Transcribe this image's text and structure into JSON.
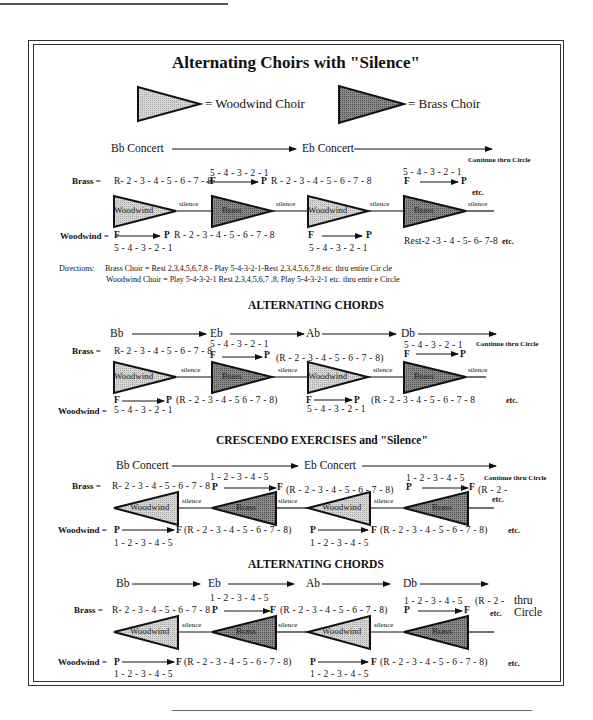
{
  "page": {
    "running_header": "",
    "title": "Alternating Choirs with \"Silence\"",
    "legend": {
      "woodwind": "= Woodwind Choir",
      "brass": "= Brass Choir",
      "woodwind_color": "#c8c8c8",
      "brass_color": "#7a7a7a"
    }
  },
  "section1": {
    "key1": "Bb Concert",
    "key2": "Eb Concert",
    "continue": "Continue thru Circle",
    "brass_label": "Brass =",
    "woodwind_label": "Woodwind =",
    "brass_rest1": "R- 2 - 3 - 4 - 5 - 6 - 7 - 8",
    "brass_play1_counts": "5 - 4 - 3 - 2 - 1",
    "brass_rest2": "R - 2 - 3 - 4 - 5 - 6 - 7 - 8",
    "brass_play2_counts": "5 - 4 - 3 - 2 - 1",
    "ww_rest1": "R - 2 - 3 - 4 - 5 - 6 - 7 - 8",
    "ww_play1_counts": "5 - 4 - 3 - 2 - 1",
    "ww_play2_counts": "5 - 4 - 3 - 2 - 1",
    "ww_rest2": "Rest-2 -3 - 4 - 5- 6- 7-8",
    "etc": "etc.",
    "F": "F",
    "P": "P",
    "silence": "silence",
    "tri_woodwind": "Woodwind",
    "tri_brass": "Brass",
    "directions_label": "Directions:",
    "directions_brass": "Brass Choir = Rest 2,3,4,5,6,7,8 - Play 5-4-3-2-1-Rest  2,3,4,5,6,7,8 etc. thru entire Cir cle",
    "directions_woodwind": "Woodwind Choir  = Play 5-4-3-2-1 Rest 2,3,4,5,6,7 ,8, Play 5-4-3-2-1 etc. thru entir e Circle"
  },
  "section2": {
    "heading": "ALTERNATING CHORDS",
    "keys": [
      "Bb",
      "Eb",
      "Ab",
      "Db"
    ],
    "continue": "Continue thru Circle",
    "brass_label": "Brass =",
    "woodwind_label": "Woodwind =",
    "brass_rest1": "R- 2 - 3 - 4 - 5 - 6 - 7 - 8",
    "brass_play1_counts": "5 - 4 - 3 - 2 - 1",
    "brass_rest2": "(R - 2 - 3 - 4 - 5 - 6 - 7 - 8)",
    "brass_play2_counts": "5 - 4 - 3 - 2 - 1",
    "ww_counts1": "5 - 4 - 3 - 2 - 1",
    "ww_rest1": "(R - 2 - 3 - 4 - 5  6 - 7 - 8)",
    "ww_counts2": "5 - 4 - 3 - 2 - 1",
    "ww_rest2": "(R - 2 - 3 - 4 - 5 - 6 - 7 - 8",
    "etc": "etc.",
    "F": "F",
    "P": "P",
    "silence": "silence",
    "tri_woodwind": "Woodwind",
    "tri_brass": "Brass"
  },
  "section3": {
    "heading": "CRESCENDO EXERCISES and \"Silence\"",
    "key1": "Bb Concert",
    "key2": "Eb Concert",
    "continue": "Continue thru Circle",
    "brass_label": "Brass =",
    "woodwind_label": "Woodwind =",
    "brass_rest1": "R- 2 - 3 - 4 - 5 - 6 - 7 - 8",
    "brass_play1_counts": "1 - 2 - 3 - 4 - 5",
    "brass_rest2": "(R - 2 - 3 - 4 - 5 - 6 - 7  -  8)",
    "brass_play2_counts": "1 - 2 - 3 - 4 - 5",
    "brass_rest3": "(R - 2 -",
    "ww_rest1": "(R - 2 - 3 - 4 - 5 - 6 - 7  -  8)",
    "ww_counts1": "1 - 2 - 3 - 4 - 5",
    "ww_rest2": "(R - 2 - 3 - 4  -  5 - 6 - 7 - 8)",
    "ww_counts2": "1 - 2 - 3 - 4 - 5",
    "etc": "etc.",
    "F": "F",
    "P": "P",
    "silence": "silence",
    "tri_woodwind": "Woodwind",
    "tri_brass": "Brass"
  },
  "section4": {
    "heading": "ALTERNATING CHORDS",
    "keys": [
      "Bb",
      "Eb",
      "Ab",
      "Db"
    ],
    "thru": "thru",
    "circle": "Circle",
    "brass_label": "Brass =",
    "woodwind_label": "Woodwind =",
    "brass_rest1": "R- 2 - 3 - 4 - 5 - 6 - 7 - 8",
    "brass_play1_counts": "1 - 2 - 3 - 4 - 5",
    "brass_rest2": "(R - 2 - 3 - 4 - 5 - 6 - 7  -  8)",
    "brass_play2_counts": "1 - 2 - 3 - 4 - 5",
    "brass_rest3": "(R - 2 -",
    "ww_rest1": "(R - 2 - 3 - 4 - 5 - 6 - 7  -  8)",
    "ww_counts1": "1 - 2 - 3 - 4 - 5",
    "ww_rest2": "(R - 2 - 3 - 4 - 5 - 6 - 7  -  8)",
    "ww_counts2": "1 - 2 - 3 - 4 - 5",
    "etc": "etc.",
    "F": "F",
    "P": "P",
    "silence": "silence",
    "tri_woodwind": "Woodwind",
    "tri_brass": "Brass"
  }
}
